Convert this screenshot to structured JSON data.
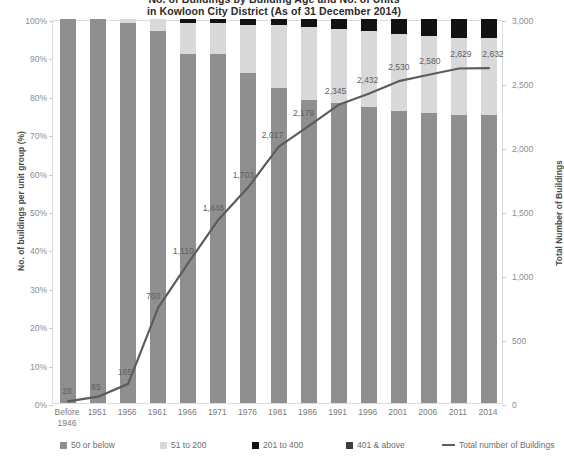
{
  "title": {
    "line1": "No. of Buildings by Building Age and No. of Units",
    "line2": "in Kowloon City District (As of 31 December 2014)"
  },
  "axes": {
    "left_title": "No. of buildings per unit group (%)",
    "right_title": "Total Number of Buildings",
    "left_ticks": [
      "0%",
      "10%",
      "20%",
      "30%",
      "40%",
      "50%",
      "60%",
      "70%",
      "80%",
      "90%",
      "100%"
    ],
    "right_ticks": [
      "0",
      "500",
      "1,000",
      "1,500",
      "2,000",
      "2,500",
      "3,000"
    ]
  },
  "legend": {
    "items": [
      {
        "label": "50 or below",
        "color": "#8f8f8f",
        "type": "swatch"
      },
      {
        "label": "51 to 200",
        "color": "#d9d9d9",
        "type": "swatch"
      },
      {
        "label": "201 to 400",
        "color": "#121212",
        "type": "swatch"
      },
      {
        "label": "401 & above",
        "color": "#3d3d3d",
        "type": "swatch"
      },
      {
        "label": "Total number of Buildings",
        "color": "#5c5c5c",
        "type": "line"
      }
    ]
  },
  "colors": {
    "series_50_or_below": "#8f8f8f",
    "series_51_to_200": "#d9d9d9",
    "series_201_to_400": "#121212",
    "series_401_and_above": "#3d3d3d",
    "total_line": "#5c5c5c",
    "axis": "#dcdcdc",
    "tick_text": "#8d8d8d"
  },
  "chart_data": {
    "type": "bar",
    "subtype": "stacked-bar-with-line-overlay",
    "title": "No. of Buildings by Building Age and No. of Units in Kowloon City District (As of 31 December 2014)",
    "xlabel": "",
    "ylabel": "No. of buildings per unit group (%)",
    "y2label": "Total Number of Buildings",
    "ylim": [
      0,
      100
    ],
    "y2lim": [
      0,
      3000
    ],
    "grid": false,
    "legend_position": "bottom",
    "categories": [
      "Before 1946",
      "1951",
      "1956",
      "1961",
      "1966",
      "1971",
      "1976",
      "1981",
      "1986",
      "1991",
      "1996",
      "2001",
      "2006",
      "2011",
      "2014"
    ],
    "series": [
      {
        "name": "50 or below",
        "stack": "pct",
        "values": [
          100,
          100,
          99,
          97,
          91,
          91,
          86,
          82,
          79,
          78,
          77,
          76,
          75.5,
          75,
          75
        ]
      },
      {
        "name": "51 to 200",
        "stack": "pct",
        "values": [
          0,
          0,
          1,
          3,
          8,
          8,
          12.5,
          16.5,
          19,
          19.5,
          20,
          20,
          20,
          20,
          20
        ]
      },
      {
        "name": "201 to 400",
        "stack": "pct",
        "values": [
          0,
          0,
          0,
          0,
          1,
          1,
          1.5,
          1.5,
          2,
          2.5,
          3,
          4,
          4.5,
          5,
          5
        ]
      },
      {
        "name": "401 & above",
        "stack": "pct",
        "values": [
          0,
          0,
          0,
          0,
          0,
          0,
          0,
          0,
          0,
          0,
          0,
          0,
          0,
          0,
          0
        ]
      }
    ],
    "line_series": {
      "name": "Total number of Buildings",
      "axis": "y2",
      "values": [
        28,
        65,
        165,
        760,
        1110,
        1448,
        1703,
        2017,
        2179,
        2345,
        2432,
        2530,
        2580,
        2629,
        2632
      ],
      "labels": [
        "28",
        "65",
        "165",
        "760",
        "1,110",
        "1,448",
        "1,703",
        "2,017",
        "2,179",
        "2,345",
        "2,432",
        "2,530",
        "2,580",
        "2,629",
        "2,632"
      ]
    }
  }
}
